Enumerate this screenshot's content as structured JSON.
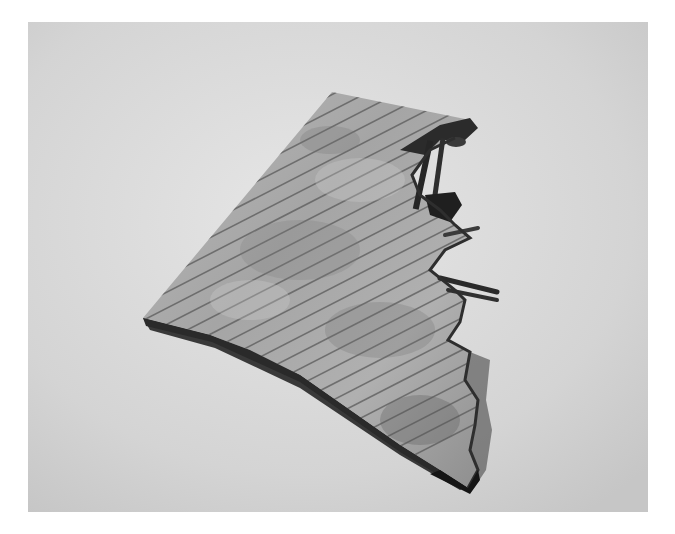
{
  "image": {
    "subject": "shingled roof section model with damaged, torn edge",
    "palette": {
      "background_light": "#e4e4e4",
      "background_mid": "#cfcfcf",
      "roof_light": "#bdbdbd",
      "roof_mid": "#9a9a9a",
      "roof_dark": "#6e6e6e",
      "shadow": "#1e1e1e"
    }
  }
}
